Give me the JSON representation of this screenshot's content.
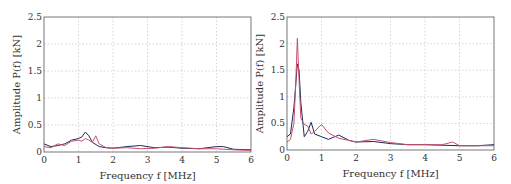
{
  "chart_data": [
    {
      "type": "line",
      "xlabel": "Frequency f [MHz]",
      "ylabel": "Amplitude P(f) [kN]",
      "xlim": [
        0,
        6
      ],
      "ylim": [
        0,
        2.5
      ],
      "xticks": [
        "0",
        "1",
        "2",
        "3",
        "4",
        "5",
        "6"
      ],
      "yticks": [
        "0",
        "0.5",
        "1",
        "1.5",
        "2",
        "2.5"
      ],
      "grid": true,
      "series": [
        {
          "name": "series-1",
          "color": "#1c2a5a",
          "x": [
            0,
            0.2,
            0.4,
            0.6,
            0.8,
            1.0,
            1.1,
            1.2,
            1.3,
            1.4,
            1.6,
            1.8,
            2.0,
            2.4,
            2.8,
            3.2,
            3.6,
            4.0,
            4.5,
            5.0,
            5.2,
            5.5,
            6.0
          ],
          "y": [
            0.15,
            0.1,
            0.12,
            0.15,
            0.22,
            0.25,
            0.28,
            0.37,
            0.3,
            0.18,
            0.1,
            0.08,
            0.07,
            0.1,
            0.12,
            0.08,
            0.09,
            0.07,
            0.06,
            0.1,
            0.1,
            0.05,
            0.04
          ]
        },
        {
          "name": "series-2",
          "color": "#c8506e",
          "x": [
            0,
            0.2,
            0.4,
            0.6,
            0.8,
            1.0,
            1.1,
            1.2,
            1.3,
            1.4,
            1.5,
            1.6,
            1.8,
            2.0,
            2.4,
            2.8,
            3.2,
            3.6,
            4.0,
            4.5,
            5.0,
            5.5,
            6.0
          ],
          "y": [
            0.1,
            0.08,
            0.15,
            0.12,
            0.2,
            0.22,
            0.2,
            0.25,
            0.22,
            0.18,
            0.3,
            0.15,
            0.08,
            0.07,
            0.08,
            0.06,
            0.07,
            0.1,
            0.08,
            0.06,
            0.06,
            0.04,
            0.03
          ]
        }
      ]
    },
    {
      "type": "line",
      "xlabel": "Frequency f [MHz]",
      "ylabel": "Amplitude P(f) [kN]",
      "xlim": [
        0,
        6
      ],
      "ylim": [
        0,
        2.5
      ],
      "xticks": [
        "0",
        "1",
        "2",
        "3",
        "4",
        "5",
        "6"
      ],
      "yticks": [
        "0",
        "0.5",
        "1",
        "1.5",
        "2",
        "2.5"
      ],
      "grid": true,
      "series": [
        {
          "name": "series-1",
          "color": "#1c2a5a",
          "x": [
            0,
            0.1,
            0.2,
            0.25,
            0.3,
            0.35,
            0.4,
            0.5,
            0.6,
            0.7,
            0.8,
            1.0,
            1.2,
            1.5,
            1.8,
            2.0,
            2.5,
            3.0,
            3.5,
            4.0,
            4.5,
            5.0,
            5.5,
            6.0
          ],
          "y": [
            0.25,
            0.3,
            0.8,
            1.2,
            1.62,
            1.5,
            0.9,
            0.25,
            0.35,
            0.52,
            0.3,
            0.25,
            0.2,
            0.28,
            0.18,
            0.15,
            0.16,
            0.12,
            0.1,
            0.1,
            0.09,
            0.08,
            0.08,
            0.1
          ]
        },
        {
          "name": "series-2",
          "color": "#c8506e",
          "x": [
            0,
            0.1,
            0.2,
            0.25,
            0.3,
            0.35,
            0.4,
            0.5,
            0.6,
            0.7,
            0.8,
            1.0,
            1.2,
            1.5,
            1.8,
            2.0,
            2.5,
            3.0,
            3.5,
            4.0,
            4.5,
            4.8,
            5.0,
            5.5,
            6.0
          ],
          "y": [
            0.15,
            0.2,
            0.5,
            1.2,
            2.1,
            1.3,
            0.6,
            0.48,
            0.45,
            0.3,
            0.35,
            0.48,
            0.32,
            0.22,
            0.18,
            0.15,
            0.2,
            0.14,
            0.1,
            0.1,
            0.1,
            0.15,
            0.08,
            0.08,
            0.08
          ]
        }
      ]
    }
  ]
}
